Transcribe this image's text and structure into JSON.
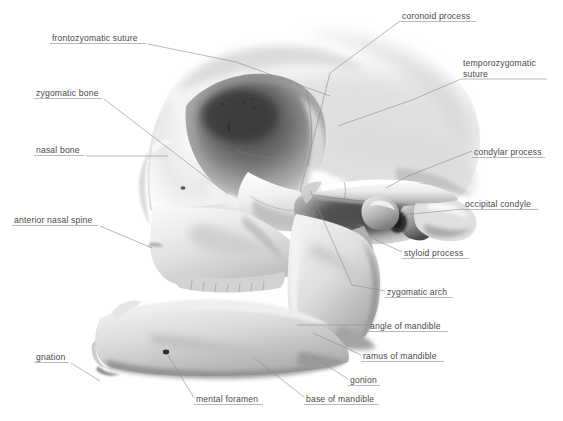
{
  "figure": {
    "panel_letter": "A",
    "background_color": "#ffffff",
    "label_color": "#4a4a4a",
    "leader_color": "#8c8c8c",
    "width": 563,
    "height": 421
  },
  "labels": [
    {
      "id": "frontozyomatic-suture",
      "text": "frontozyomatic suture",
      "x": 52,
      "y": 33,
      "text_w": 94,
      "underline_from": "left",
      "leader": [
        [
          148,
          44
        ],
        [
          236,
          62
        ],
        [
          330,
          96
        ]
      ]
    },
    {
      "id": "zygomatic-bone",
      "text": "zygomatic bone",
      "x": 36,
      "y": 88,
      "text_w": 66,
      "underline_from": "left",
      "leader": [
        [
          104,
          99
        ],
        [
          228,
          194
        ]
      ]
    },
    {
      "id": "nasal-bone",
      "text": "nasal bone",
      "x": 36,
      "y": 145,
      "text_w": 48,
      "underline_from": "left",
      "leader": [
        [
          86,
          156
        ],
        [
          168,
          156
        ]
      ]
    },
    {
      "id": "anterior-nasal-spine",
      "text": "anterior nasal spine",
      "x": 14,
      "y": 215,
      "text_w": 84,
      "underline_from": "left",
      "leader": [
        [
          100,
          226
        ],
        [
          152,
          248
        ]
      ]
    },
    {
      "id": "gnation",
      "text": "gnation",
      "x": 36,
      "y": 352,
      "text_w": 33,
      "underline_from": "left",
      "leader": [
        [
          71,
          363
        ],
        [
          100,
          381
        ]
      ]
    },
    {
      "id": "mental-foramen",
      "text": "mental foramen",
      "x": 196,
      "y": 394,
      "text_w": 67,
      "underline_from": "left",
      "leader": [
        [
          194,
          398
        ],
        [
          168,
          355
        ]
      ]
    },
    {
      "id": "base-of-mandible",
      "text": "base of mandible",
      "x": 306,
      "y": 394,
      "text_w": 73,
      "underline_from": "left",
      "leader": [
        [
          304,
          397
        ],
        [
          253,
          357
        ]
      ]
    },
    {
      "id": "gonion",
      "text": "gonion",
      "x": 350,
      "y": 375,
      "text_w": 30,
      "underline_from": "left",
      "leader": [
        [
          348,
          379
        ],
        [
          312,
          356
        ]
      ]
    },
    {
      "id": "ramus-of-mandible",
      "text": "ramus of mandible",
      "x": 363,
      "y": 351,
      "text_w": 81,
      "underline_from": "left",
      "leader": [
        [
          361,
          355
        ],
        [
          313,
          333
        ]
      ]
    },
    {
      "id": "angle-of-mandible",
      "text": "angle of mandible",
      "x": 370,
      "y": 321,
      "text_w": 78,
      "underline_from": "left",
      "leader": [
        [
          368,
          325
        ],
        [
          297,
          325
        ]
      ]
    },
    {
      "id": "zygomatic-arch",
      "text": "zygomatic arch",
      "x": 387,
      "y": 287,
      "text_w": 66,
      "underline_from": "left",
      "leader": [
        [
          385,
          291
        ],
        [
          352,
          285
        ],
        [
          310,
          190
        ]
      ]
    },
    {
      "id": "styloid-process",
      "text": "styloid process",
      "x": 404,
      "y": 248,
      "text_w": 65,
      "underline_from": "left",
      "leader": [
        [
          402,
          252
        ],
        [
          376,
          240
        ],
        [
          358,
          224
        ]
      ]
    },
    {
      "id": "occipital-condyle",
      "text": "occipital condyle",
      "x": 465,
      "y": 199,
      "text_w": 73,
      "underline_from": "left",
      "leader": [
        [
          463,
          209
        ],
        [
          402,
          215
        ]
      ]
    },
    {
      "id": "condylar-process",
      "text": "condylar process",
      "x": 474,
      "y": 147,
      "text_w": 71,
      "underline_from": "left",
      "leader": [
        [
          472,
          151
        ],
        [
          408,
          176
        ],
        [
          386,
          188
        ]
      ]
    },
    {
      "id": "temporozygomatic-suture",
      "text": "temporozygomatic suture",
      "x": 463,
      "y": 58,
      "text_w": 84,
      "two_line": true,
      "underline_from": "left",
      "leader": [
        [
          461,
          79
        ],
        [
          412,
          100
        ],
        [
          338,
          126
        ]
      ]
    },
    {
      "id": "coronoid-process",
      "text": "coronoid process",
      "x": 402,
      "y": 11,
      "text_w": 74,
      "underline_from": "left",
      "leader": [
        [
          400,
          21
        ],
        [
          330,
          73
        ],
        [
          300,
          192
        ]
      ]
    }
  ],
  "anatomy": {
    "regions": [
      "frontal-bone",
      "orbit",
      "zygomatic-bone",
      "maxilla",
      "nasal-aperture",
      "temporal-bone",
      "zygomatic-arch",
      "mandible-ramus",
      "mandible-body",
      "condylar-process",
      "styloid-process",
      "mastoid-process"
    ]
  }
}
